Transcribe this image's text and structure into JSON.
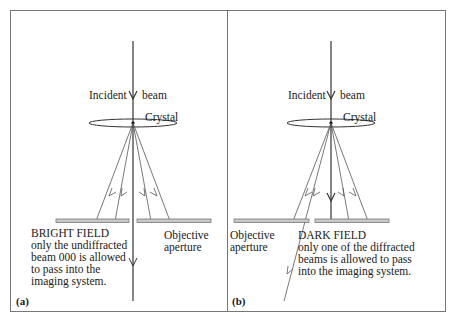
{
  "figure": {
    "panel_a": {
      "tag": "(a)",
      "incident_left": "Incident",
      "incident_right": "beam",
      "crystal": "Crystal",
      "mode_title": "BRIGHT FIELD",
      "mode_desc": [
        "only the undiffracted",
        "beam 000 is allowed",
        "to pass into the",
        "imaging system."
      ],
      "aperture_label": [
        "Objective",
        "aperture"
      ]
    },
    "panel_b": {
      "tag": "(b)",
      "incident_left": "Incident",
      "incident_right": "beam",
      "crystal": "Crystal",
      "mode_title": "DARK FIELD",
      "mode_desc": [
        "only one of the diffracted",
        "beams is allowed to pass",
        "into the imaging system."
      ],
      "aperture_label": [
        "Objective",
        "aperture"
      ]
    }
  },
  "colors": {
    "border": "#777777",
    "ray": "#555555",
    "aperture_fill": "#c8c8c8",
    "aperture_stroke": "#777777"
  }
}
